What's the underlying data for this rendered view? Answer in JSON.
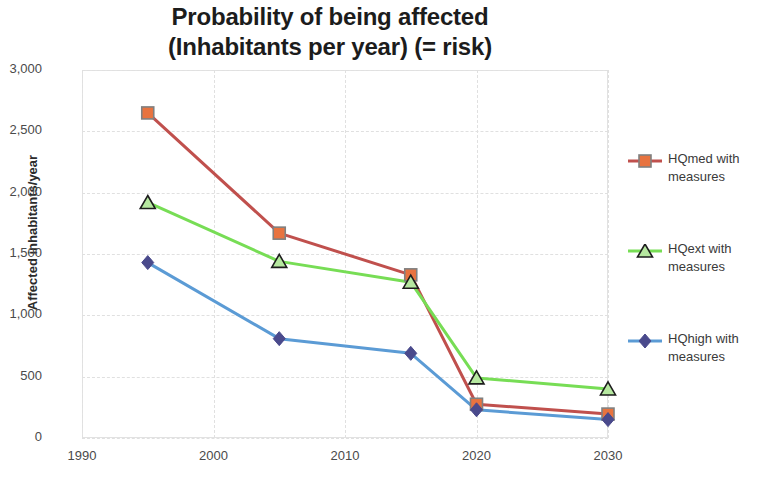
{
  "chart_data": {
    "type": "line",
    "title": "Probability of being affected (Inhabitants per year) (= risk)",
    "title_line1": "Probability of being affected",
    "title_line2": "(Inhabitants per year) (= risk)",
    "xlabel": "",
    "ylabel": "Affected inhabitants/year",
    "x": [
      1995,
      2005,
      2015,
      2020,
      2030
    ],
    "xlim": [
      1990,
      2030
    ],
    "ylim": [
      0,
      3000
    ],
    "xticks": [
      "1990",
      "2000",
      "2010",
      "2020",
      "2030"
    ],
    "xtick_values": [
      1990,
      2000,
      2010,
      2020,
      2030
    ],
    "yticks": [
      "0",
      "500",
      "1,000",
      "1,500",
      "2,000",
      "2,500",
      "3,000"
    ],
    "ytick_values": [
      0,
      500,
      1000,
      1500,
      2000,
      2500,
      3000
    ],
    "grid": true,
    "legend_position": "right",
    "series": [
      {
        "name": "HQmed with measures",
        "label_line1": "HQmed with",
        "label_line2": "measures",
        "color": "#c0504d",
        "marker": "square",
        "marker_fill": "#e8733f",
        "marker_edge": "#808080",
        "values": [
          2650,
          1670,
          1330,
          275,
          195
        ]
      },
      {
        "name": "HQext with measures",
        "label_line1": "HQext with",
        "label_line2": "measures",
        "color": "#77dd55",
        "marker": "triangle",
        "marker_fill": "#b6e8a0",
        "marker_edge": "#1d1d1d",
        "values": [
          1920,
          1440,
          1270,
          490,
          400
        ]
      },
      {
        "name": "HQhigh with measures",
        "label_line1": "HQhigh with",
        "label_line2": "measures",
        "color": "#5b9bd5",
        "marker": "diamond",
        "marker_fill": "#4a4a8c",
        "marker_edge": "#4a4a8c",
        "values": [
          1430,
          810,
          690,
          230,
          150
        ]
      }
    ]
  }
}
